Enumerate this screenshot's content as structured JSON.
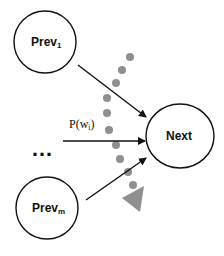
{
  "nodes": {
    "prev1": {
      "label": "Prev",
      "sub": "1"
    },
    "prevm": {
      "label": "Prev",
      "sub": "m"
    },
    "next": {
      "label": "Next"
    }
  },
  "edge_label": {
    "text": "P(w",
    "sub": "i",
    "close": ")"
  },
  "ellipsis": "…",
  "colors": {
    "stroke": "#111111",
    "dots": "#8f8f8f"
  }
}
